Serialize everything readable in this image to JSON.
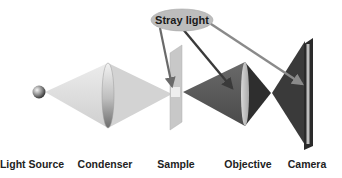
{
  "diagram": {
    "stray_light_label": "Stray light",
    "components": [
      {
        "id": "light-source",
        "label": "Light Source"
      },
      {
        "id": "condenser",
        "label": "Condenser"
      },
      {
        "id": "sample",
        "label": "Sample"
      },
      {
        "id": "objective",
        "label": "Objective"
      },
      {
        "id": "camera",
        "label": "Camera"
      }
    ],
    "arrows": [
      {
        "from": "Stray light",
        "to": "Sample"
      },
      {
        "from": "Stray light",
        "to": "Objective"
      },
      {
        "from": "Stray light",
        "to": "Camera"
      }
    ],
    "colors": {
      "illumination_cone": "#d9d9d9",
      "imaging_cone": "#5a5a5a",
      "label_ellipse": "#bdbdbd",
      "arrow_dark": "#3a3a3a",
      "arrow_light": "#8a8a8a"
    }
  }
}
